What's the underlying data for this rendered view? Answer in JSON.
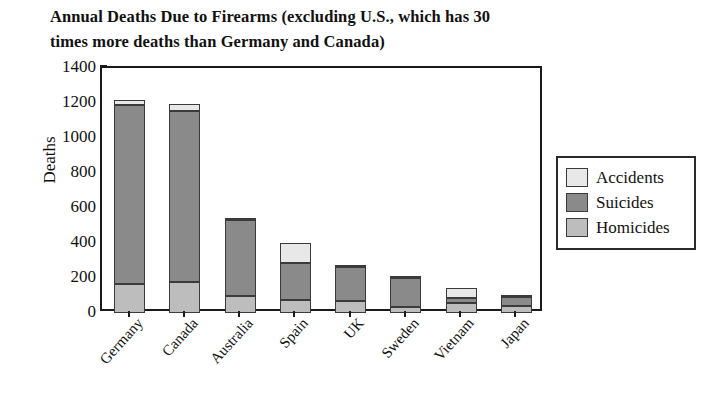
{
  "chart_data": {
    "type": "bar",
    "subtype": "stacked",
    "title": "Annual Deaths Due to Firearms (excluding U.S., which has 30 times more deaths than Germany and Canada)",
    "xlabel": "",
    "ylabel": "Deaths",
    "ylim": [
      0,
      1400
    ],
    "ytick_step": 200,
    "yticks": [
      1400,
      1200,
      1000,
      800,
      600,
      400,
      200,
      0
    ],
    "ytick_labels": [
      "1400",
      "1200",
      "1000",
      "800",
      "600",
      "400",
      "200",
      "0"
    ],
    "grid": false,
    "legend_position": "right",
    "categories": [
      "Germany",
      "Canada",
      "Australia",
      "Spain",
      "UK",
      "Sweden",
      "Vietnam",
      "Japan"
    ],
    "stack_order_bottom_to_top": [
      "Homicides",
      "Suicides",
      "Accidents"
    ],
    "series": [
      {
        "name": "Homicides",
        "color": "#bdbdbd",
        "values": [
          165,
          180,
          95,
          75,
          70,
          35,
          60,
          40
        ]
      },
      {
        "name": "Suicides",
        "color": "#8a8a8a",
        "values": [
          1025,
          975,
          435,
          210,
          195,
          165,
          25,
          50
        ]
      },
      {
        "name": "Accidents",
        "color": "#e8e8e8",
        "values": [
          25,
          40,
          5,
          115,
          5,
          5,
          60,
          5
        ]
      }
    ],
    "totals": [
      1215,
      1195,
      535,
      400,
      270,
      205,
      145,
      95
    ]
  },
  "legend": {
    "items": [
      {
        "label": "Accidents",
        "color": "#e8e8e8"
      },
      {
        "label": "Suicides",
        "color": "#8a8a8a"
      },
      {
        "label": "Homicides",
        "color": "#bdbdbd"
      }
    ]
  },
  "colors": {
    "axis": "#1a1a1a",
    "text": "#111111",
    "background": "#ffffff",
    "accidents": "#e8e8e8",
    "suicides": "#8a8a8a",
    "homicides": "#bdbdbd"
  }
}
